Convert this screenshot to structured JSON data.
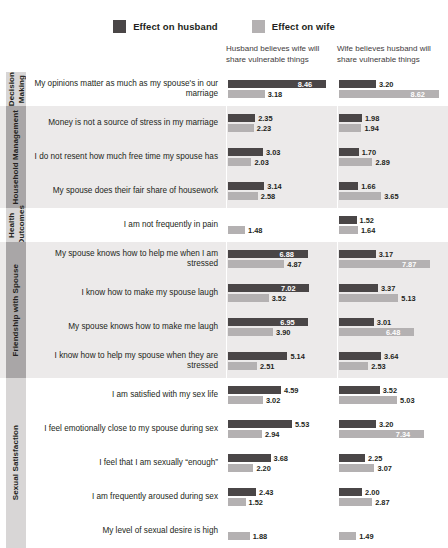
{
  "legend": {
    "items": [
      {
        "label": "Effect on husband",
        "color": "#4a4647",
        "name": "husband"
      },
      {
        "label": "Effect on wife",
        "color": "#b4b1b2",
        "name": "wife"
      }
    ]
  },
  "columns": [
    {
      "header": "Husband believes wife will share vulnerable things"
    },
    {
      "header": "Wife believes husband will share vulnerable things"
    }
  ],
  "chart_data": {
    "type": "bar",
    "title": "",
    "xlabel": "",
    "ylabel": "",
    "orientation": "horizontal",
    "grid": false,
    "legend_position": "top-center",
    "xlim": [
      0,
      9
    ],
    "series": [
      {
        "name": "Effect on husband",
        "color": "#4a4647"
      },
      {
        "name": "Effect on wife",
        "color": "#b4b1b2"
      }
    ],
    "columns": [
      "Husband believes wife will share vulnerable things",
      "Wife believes husband will share vulnerable things"
    ],
    "groups": [
      {
        "category": "Decision Making",
        "shaded": false,
        "rows": [
          {
            "label": "My opinions matter as much as my spouse's in our marriage",
            "col1": {
              "husband": 8.46,
              "wife": 3.18
            },
            "col2": {
              "husband": 3.2,
              "wife": 8.62
            }
          }
        ]
      },
      {
        "category": "Household Management",
        "shaded": true,
        "rows": [
          {
            "label": "Money is not a source of stress in my marriage",
            "col1": {
              "husband": 2.35,
              "wife": 2.23
            },
            "col2": {
              "husband": 1.98,
              "wife": 1.94
            }
          },
          {
            "label": "I do not resent how much free time my spouse has",
            "col1": {
              "husband": 3.03,
              "wife": 2.03
            },
            "col2": {
              "husband": 1.7,
              "wife": 2.89
            }
          },
          {
            "label": "My spouse does their fair share of housework",
            "col1": {
              "husband": 3.14,
              "wife": 2.58
            },
            "col2": {
              "husband": 1.66,
              "wife": 3.65
            }
          }
        ]
      },
      {
        "category": "Health Outcomes",
        "shaded": false,
        "rows": [
          {
            "label": "I am not frequently in pain",
            "col1": {
              "husband": null,
              "wife": 1.48
            },
            "col2": {
              "husband": 1.52,
              "wife": 1.64
            }
          }
        ]
      },
      {
        "category": "Friendship with Spouse",
        "shaded": true,
        "rows": [
          {
            "label": "My spouse knows how to help me when I am stressed",
            "col1": {
              "husband": 6.88,
              "wife": 4.87
            },
            "col2": {
              "husband": 3.17,
              "wife": 7.87
            }
          },
          {
            "label": "I know how to make my spouse laugh",
            "col1": {
              "husband": 7.02,
              "wife": 3.52
            },
            "col2": {
              "husband": 3.37,
              "wife": 5.13
            }
          },
          {
            "label": "My spouse knows how to make me laugh",
            "col1": {
              "husband": 6.95,
              "wife": 3.9
            },
            "col2": {
              "husband": 3.01,
              "wife": 6.48
            }
          },
          {
            "label": "I know how to help my spouse when they are stressed",
            "col1": {
              "husband": 5.14,
              "wife": 2.51
            },
            "col2": {
              "husband": 3.64,
              "wife": 2.53
            }
          }
        ]
      },
      {
        "category": "Sexual Satisfaction",
        "shaded": false,
        "rows": [
          {
            "label": "I am satisfied with my sex life",
            "col1": {
              "husband": 4.59,
              "wife": 3.02
            },
            "col2": {
              "husband": 3.52,
              "wife": 5.03
            }
          },
          {
            "label": "I feel emotionally close to my spouse during sex",
            "col1": {
              "husband": 5.53,
              "wife": 2.94
            },
            "col2": {
              "husband": 3.2,
              "wife": 7.34
            }
          },
          {
            "label": "I feel that I am sexually “enough”",
            "col1": {
              "husband": 3.68,
              "wife": 2.2
            },
            "col2": {
              "husband": 2.25,
              "wife": 3.07
            }
          },
          {
            "label": "I am frequently aroused during sex",
            "col1": {
              "husband": 2.43,
              "wife": 1.52
            },
            "col2": {
              "husband": 2.0,
              "wife": 2.87
            }
          },
          {
            "label": "My level of sexual desire is high",
            "col1": {
              "husband": null,
              "wife": 1.88
            },
            "col2": {
              "husband": null,
              "wife": 1.49
            }
          }
        ]
      }
    ]
  }
}
